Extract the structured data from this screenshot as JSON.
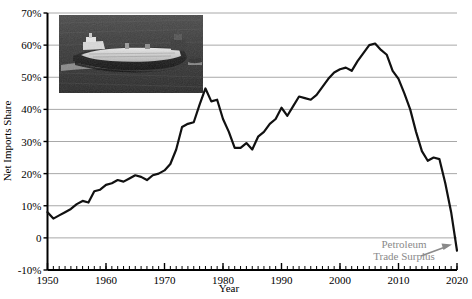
{
  "chart_data": {
    "type": "line",
    "title": "",
    "xlabel": "Year",
    "ylabel": "Net Imports Share",
    "xlim": [
      1950,
      2020
    ],
    "ylim": [
      -10,
      70
    ],
    "ytick_labels": [
      "70%",
      "60%",
      "50%",
      "40%",
      "30%",
      "20%",
      "10%",
      "0",
      "-10%"
    ],
    "ytick_values": [
      70,
      60,
      50,
      40,
      30,
      20,
      10,
      0,
      -10
    ],
    "xtick_labels": [
      "1950",
      "1960",
      "1970",
      "1980",
      "1990",
      "2000",
      "2010",
      "2020"
    ],
    "xtick_values": [
      1950,
      1960,
      1970,
      1980,
      1990,
      2000,
      2010,
      2020
    ],
    "minor_xticks_every": 1,
    "grid": "horizontal",
    "legend": "none",
    "series": [
      {
        "name": "Net Imports Share",
        "color": "#111111",
        "x": [
          1950,
          1951,
          1952,
          1953,
          1954,
          1955,
          1956,
          1957,
          1958,
          1959,
          1960,
          1961,
          1962,
          1963,
          1964,
          1965,
          1966,
          1967,
          1968,
          1969,
          1970,
          1971,
          1972,
          1973,
          1974,
          1975,
          1976,
          1977,
          1978,
          1979,
          1980,
          1981,
          1982,
          1983,
          1984,
          1985,
          1986,
          1987,
          1988,
          1989,
          1990,
          1991,
          1992,
          1993,
          1994,
          1995,
          1996,
          1997,
          1998,
          1999,
          2000,
          2001,
          2002,
          2003,
          2004,
          2005,
          2006,
          2007,
          2008,
          2009,
          2010,
          2011,
          2012,
          2013,
          2014,
          2015,
          2016,
          2017,
          2018,
          2019,
          2020
        ],
        "values": [
          8.0,
          6.0,
          7.0,
          8.0,
          9.0,
          10.5,
          11.5,
          11.0,
          14.5,
          15.0,
          16.5,
          17.0,
          18.0,
          17.5,
          18.5,
          19.5,
          19.0,
          18.0,
          19.5,
          20.0,
          21.0,
          23.0,
          27.5,
          34.5,
          35.5,
          36.0,
          41.5,
          46.5,
          42.5,
          43.0,
          37.0,
          33.0,
          28.0,
          28.0,
          29.5,
          27.5,
          31.5,
          33.0,
          35.5,
          37.0,
          40.5,
          38.0,
          41.0,
          44.0,
          43.5,
          43.0,
          44.5,
          47.0,
          49.5,
          51.5,
          52.5,
          53.0,
          52.0,
          55.0,
          57.5,
          60.0,
          60.5,
          58.5,
          57.0,
          52.0,
          49.5,
          45.0,
          40.0,
          33.0,
          27.0,
          24.0,
          25.0,
          24.5,
          17.0,
          8.0,
          -4.0
        ]
      }
    ],
    "annotations": [
      {
        "name": "petroleum-trade-surplus",
        "line1": "Petroleum",
        "line2": "Trade Surplus",
        "color": "#8a8a8a",
        "arrow": "points-right-up-to-line-end"
      }
    ],
    "inset_image": {
      "name": "oil-tanker-photo",
      "description": "grayscale aerial photograph of a loaded crude oil tanker at sea"
    }
  },
  "axis": {
    "x_title": "Year",
    "y_title": "Net Imports Share"
  }
}
